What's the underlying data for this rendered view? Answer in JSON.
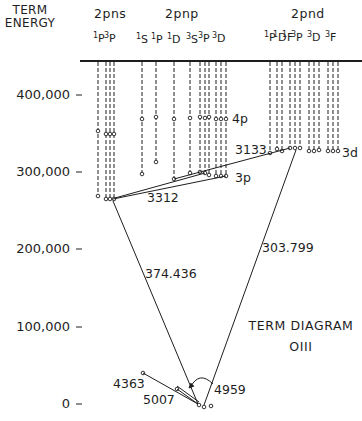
{
  "header": {
    "axis_title_line1": "TERM",
    "axis_title_line2": "ENERGY"
  },
  "groups": [
    {
      "label": "2pns",
      "terms": [
        {
          "mult": "1",
          "L": "P"
        },
        {
          "mult": "3",
          "L": "P"
        }
      ]
    },
    {
      "label": "2pnp",
      "terms": [
        {
          "mult": "1",
          "L": "S"
        },
        {
          "mult": "1",
          "L": "P"
        },
        {
          "mult": "1",
          "L": "D"
        },
        {
          "mult": "3",
          "L": "S"
        },
        {
          "mult": "3",
          "L": "P"
        },
        {
          "mult": "3",
          "L": "D"
        }
      ]
    },
    {
      "label": "2pnd",
      "terms": [
        {
          "mult": "1",
          "L": "P"
        },
        {
          "mult": "1",
          "L": "D"
        },
        {
          "mult": "1",
          "L": "F"
        },
        {
          "mult": "3",
          "L": "P"
        },
        {
          "mult": "3",
          "L": "D"
        },
        {
          "mult": "3",
          "L": "F"
        }
      ]
    }
  ],
  "y_axis": {
    "ticks": [
      "400,000",
      "300,000",
      "200,000",
      "100,000",
      "0"
    ],
    "tick_values": [
      400000,
      300000,
      200000,
      100000,
      0
    ]
  },
  "level_labels": {
    "p4": "4p",
    "p3": "3p",
    "d3": "3d"
  },
  "transitions": {
    "t3133": "3133",
    "t3312": "3312",
    "t374": "374.436",
    "t303": "303.799",
    "t4363": "4363",
    "t5007": "5007",
    "t4959": "4959"
  },
  "title": {
    "line1": "TERM DIAGRAM",
    "line2": "OIII"
  },
  "colors": {
    "ink": "#1e1e1e",
    "background": "#ffffff"
  }
}
